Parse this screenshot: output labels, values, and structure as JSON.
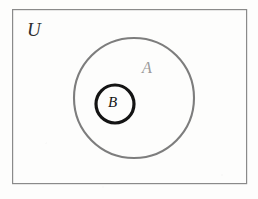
{
  "figure": {
    "type": "venn-diagram",
    "background_color": "#fdfdfc",
    "labels": {
      "universe": "U",
      "outer_set": "A",
      "inner_set": "B"
    },
    "shapes": {
      "universe_rect": {
        "name": "U",
        "x": 12,
        "y": 9,
        "width": 235,
        "height": 175,
        "stroke_color": "#8a8a8a",
        "stroke_width": 1.2,
        "fill": "none"
      },
      "outer_circle": {
        "name": "A",
        "cx": 134,
        "cy": 98,
        "r": 60,
        "stroke_color": "#7d7d7d",
        "stroke_width": 2.1,
        "fill": "none"
      },
      "inner_circle": {
        "name": "B",
        "cx": 115,
        "cy": 104,
        "r": 19,
        "stroke_color": "#141414",
        "stroke_width": 3.2,
        "fill": "none"
      }
    },
    "label_colors": {
      "universe": "#2e2e2e",
      "outer_set": "#9a9a9a",
      "inner_set": "#161616"
    }
  }
}
